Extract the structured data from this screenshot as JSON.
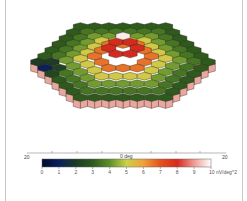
{
  "chart_data": {
    "type": "heatmap",
    "subtype": "3d-hexagonal-topography",
    "title": "",
    "rings": 7,
    "values_by_ring": [
      9.8,
      8.0,
      6.6,
      5.2,
      4.2,
      3.5,
      3.0
    ],
    "blind_spot": {
      "ring": 5,
      "direction": "left",
      "value": 0.8
    },
    "xaxis": {
      "left_label": "20",
      "center_label": "0 deg",
      "right_label": "20"
    },
    "colorbar": {
      "min": 0,
      "max": 10,
      "tick_labels": [
        "0",
        "1",
        "2",
        "3",
        "4",
        "5",
        "6",
        "7",
        "8",
        "9",
        "10 nV/deg^2"
      ],
      "unit": "nV/deg^2",
      "stops": [
        {
          "v": 0,
          "color": "#000a2a"
        },
        {
          "v": 1,
          "color": "#0b1f5c"
        },
        {
          "v": 2,
          "color": "#1d3a26"
        },
        {
          "v": 3,
          "color": "#2e5a1e"
        },
        {
          "v": 4,
          "color": "#5e8f2a"
        },
        {
          "v": 5,
          "color": "#c9d24a"
        },
        {
          "v": 6,
          "color": "#f0a03a"
        },
        {
          "v": 7,
          "color": "#e5521e"
        },
        {
          "v": 8,
          "color": "#d62a1e"
        },
        {
          "v": 9,
          "color": "#ef9c94"
        },
        {
          "v": 10,
          "color": "#ffffff"
        }
      ]
    },
    "side_wall_color": "#e8a8a0"
  }
}
